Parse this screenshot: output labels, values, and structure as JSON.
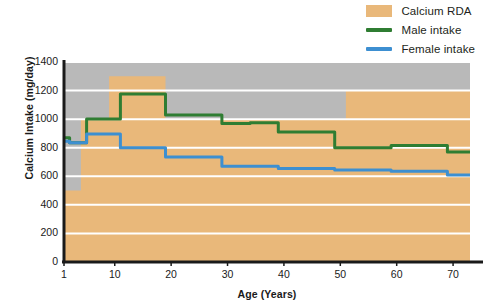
{
  "legend": {
    "position": "top-right",
    "items": [
      {
        "label": "Calcium RDA",
        "type": "area",
        "color": "#e9b87a",
        "name": "calcium-rda"
      },
      {
        "label": "Male intake",
        "type": "line",
        "color": "#2f7d32",
        "name": "male-intake"
      },
      {
        "label": "Female intake",
        "type": "line",
        "color": "#3d8fd1",
        "name": "female-intake"
      }
    ]
  },
  "axes": {
    "xlabel": "Age (Years)",
    "ylabel": "Calcium Intake (mg/day)",
    "xticks": [
      "1",
      "10",
      "20",
      "30",
      "40",
      "50",
      "60",
      "70"
    ],
    "yticks": [
      "1400",
      "1200",
      "1000",
      "800",
      "600",
      "400",
      "200",
      "0"
    ]
  },
  "chart_data": {
    "type": "area",
    "title": "",
    "subtitle": "",
    "xlabel": "Age (Years)",
    "ylabel": "Calcium Intake (mg/day)",
    "xlim": [
      1,
      73
    ],
    "ylim": [
      0,
      1400
    ],
    "xticks": [
      1,
      10,
      20,
      30,
      40,
      50,
      60,
      70
    ],
    "yticks": [
      0,
      200,
      400,
      600,
      800,
      1000,
      1200,
      1400
    ],
    "grid": true,
    "grid_color": "#ffffff",
    "plot_background": "#b9b9b9",
    "legend": [
      "Calcium RDA",
      "Male intake",
      "Female intake"
    ],
    "legend_position": "top-right",
    "series": [
      {
        "name": "Calcium RDA",
        "type": "step-area",
        "color": "#e9b87a",
        "note": "Recommended Dietary Allowance band filled from 0 up to the step value",
        "steps": [
          {
            "x_start": 1,
            "x_end": 4,
            "value": 500
          },
          {
            "x_start": 4,
            "x_end": 9,
            "value": 1000
          },
          {
            "x_start": 9,
            "x_end": 19,
            "value": 1300
          },
          {
            "x_start": 19,
            "x_end": 51,
            "value": 1000
          },
          {
            "x_start": 51,
            "x_end": 73,
            "value": 1200
          }
        ]
      },
      {
        "name": "Male intake",
        "type": "step-line",
        "color": "#2f7d32",
        "steps": [
          {
            "x_start": 1,
            "x_end": 2,
            "value": 870
          },
          {
            "x_start": 2,
            "x_end": 5,
            "value": 835
          },
          {
            "x_start": 5,
            "x_end": 11,
            "value": 1000
          },
          {
            "x_start": 11,
            "x_end": 19,
            "value": 1175
          },
          {
            "x_start": 19,
            "x_end": 29,
            "value": 1030
          },
          {
            "x_start": 29,
            "x_end": 34,
            "value": 970
          },
          {
            "x_start": 34,
            "x_end": 39,
            "value": 975
          },
          {
            "x_start": 39,
            "x_end": 49,
            "value": 910
          },
          {
            "x_start": 49,
            "x_end": 59,
            "value": 800
          },
          {
            "x_start": 59,
            "x_end": 69,
            "value": 815
          },
          {
            "x_start": 69,
            "x_end": 73,
            "value": 770
          }
        ]
      },
      {
        "name": "Female intake",
        "type": "step-line",
        "color": "#3d8fd1",
        "steps": [
          {
            "x_start": 1,
            "x_end": 2,
            "value": 845
          },
          {
            "x_start": 2,
            "x_end": 5,
            "value": 835
          },
          {
            "x_start": 5,
            "x_end": 11,
            "value": 895
          },
          {
            "x_start": 11,
            "x_end": 19,
            "value": 800
          },
          {
            "x_start": 19,
            "x_end": 29,
            "value": 735
          },
          {
            "x_start": 29,
            "x_end": 39,
            "value": 670
          },
          {
            "x_start": 39,
            "x_end": 49,
            "value": 655
          },
          {
            "x_start": 49,
            "x_end": 59,
            "value": 645
          },
          {
            "x_start": 59,
            "x_end": 69,
            "value": 635
          },
          {
            "x_start": 69,
            "x_end": 73,
            "value": 610
          }
        ]
      }
    ]
  }
}
